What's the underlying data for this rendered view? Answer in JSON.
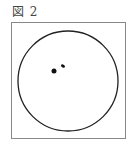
{
  "figure": {
    "caption": "図 2",
    "frame": {
      "x": 11,
      "y": 22,
      "width": 115,
      "height": 117,
      "stroke": "#888888"
    },
    "circle": {
      "cx": 68,
      "cy": 81,
      "r": 50,
      "stroke": "#222222"
    },
    "dots": [
      {
        "cx": 54,
        "cy": 71,
        "rx": 2.5,
        "ry": 2.5
      },
      {
        "cx": 63,
        "cy": 66,
        "rx": 2.2,
        "ry": 1.4
      }
    ]
  }
}
